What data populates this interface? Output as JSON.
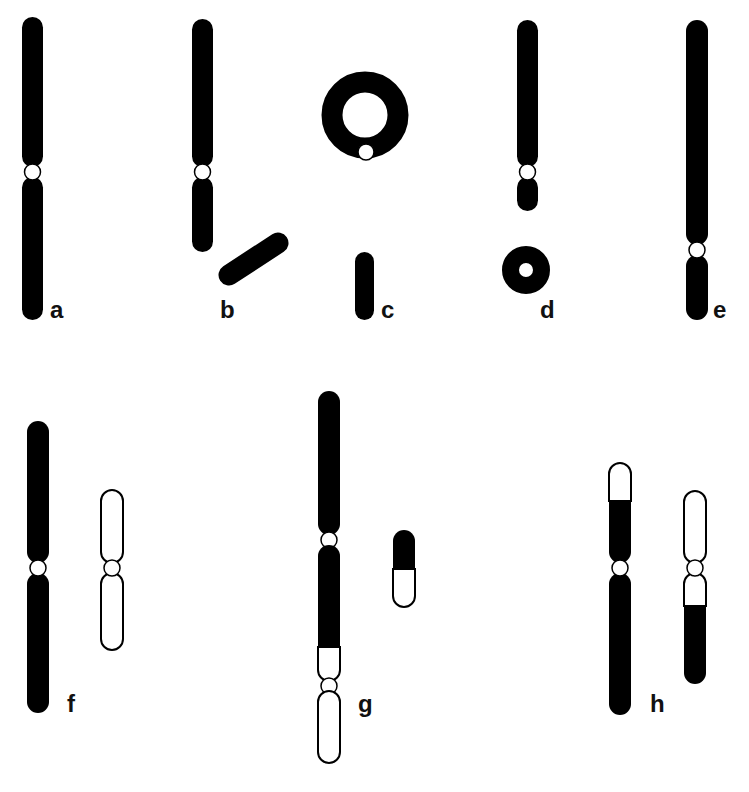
{
  "figure": {
    "type": "chromosome-aberration-diagram",
    "fill_color": "#000000",
    "background_color": "#ffffff",
    "panels": [
      {
        "label": "a",
        "description": "normal chromosome, metacentric"
      },
      {
        "label": "b",
        "description": "terminal deletion with acentric fragment"
      },
      {
        "label": "c",
        "description": "ring chromosome with centric ring and acentric fragment"
      },
      {
        "label": "d",
        "description": "interstitial deletion forming acentric ring"
      },
      {
        "label": "e",
        "description": "inversion / centromere repositioned"
      },
      {
        "label": "f",
        "description": "pair of non-homologous chromosomes, one black one white"
      },
      {
        "label": "g",
        "description": "dicentric chromosome with acentric fragment"
      },
      {
        "label": "h",
        "description": "reciprocal translocation"
      }
    ]
  }
}
